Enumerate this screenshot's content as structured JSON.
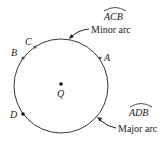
{
  "diagram": {
    "type": "circle-arcs",
    "circle": {
      "center_label": "Q",
      "cx": 61,
      "cy": 86,
      "r": 47,
      "stroke": "#333333"
    },
    "points": [
      {
        "label": "A",
        "x": 100,
        "y": 58
      },
      {
        "label": "B",
        "x": 23,
        "y": 58
      },
      {
        "label": "C",
        "x": 35,
        "y": 47
      },
      {
        "label": "D",
        "x": 23,
        "y": 114
      },
      {
        "label": "Q",
        "x": 61,
        "y": 84
      }
    ],
    "annotations": {
      "minor_arc": {
        "arc_name": "ACB",
        "caption": "Minor arc"
      },
      "major_arc": {
        "arc_name": "ADB",
        "caption": "Major arc"
      }
    }
  }
}
